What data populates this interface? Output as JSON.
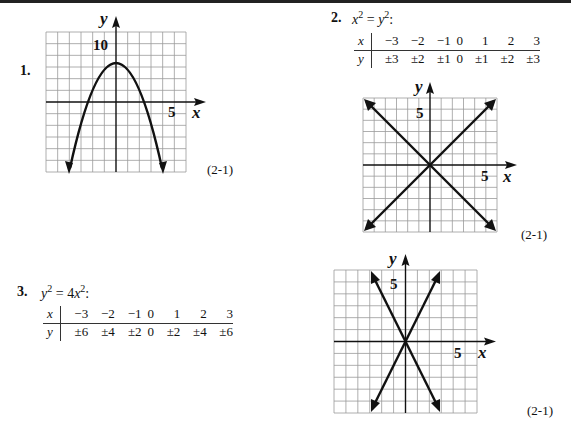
{
  "problems": [
    {
      "number": "1.",
      "reference": "(2-1)",
      "graph": {
        "x_axis_label": "x",
        "y_axis_label": "y",
        "x_tick_label": "5",
        "y_tick_label": "10"
      }
    },
    {
      "number": "2.",
      "equation": {
        "lhs_var": "x",
        "lhs_exp": "2",
        "eq": " = ",
        "rhs_var": "y",
        "rhs_exp": "2",
        "colon": ":"
      },
      "table": {
        "x_header": "x",
        "y_header": "y",
        "x_values": [
          "−3",
          "−2",
          "−1",
          "0",
          "1",
          "2",
          "3"
        ],
        "y_values": [
          "±3",
          "±2",
          "±1",
          "0",
          "±1",
          "±2",
          "±3"
        ]
      },
      "reference": "(2-1)",
      "graph": {
        "x_axis_label": "x",
        "y_axis_label": "y",
        "x_tick_label": "5",
        "y_tick_label": "5"
      }
    },
    {
      "number": "3.",
      "equation": {
        "lhs_var": "y",
        "lhs_exp": "2",
        "eq": " = ",
        "coef": "4",
        "rhs_var": "x",
        "rhs_exp": "2",
        "colon": ":"
      },
      "table": {
        "x_header": "x",
        "y_header": "y",
        "x_values": [
          "−3",
          "−2",
          "−1",
          "0",
          "1",
          "2",
          "3"
        ],
        "y_values": [
          "±6",
          "±4",
          "±2",
          "0",
          "±2",
          "±4",
          "±6"
        ]
      },
      "reference": "(2-1)",
      "graph": {
        "x_axis_label": "x",
        "y_axis_label": "y",
        "x_tick_label": "5",
        "y_tick_label": "5"
      }
    }
  ]
}
